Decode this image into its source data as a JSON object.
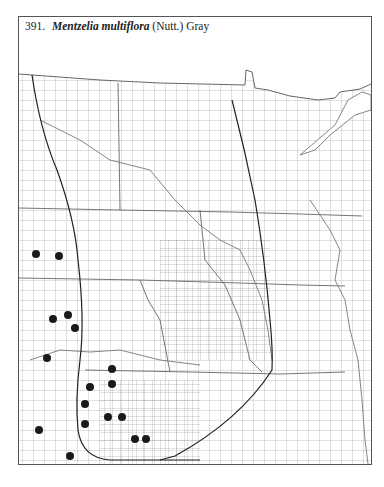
{
  "map": {
    "number": "391.",
    "scientific_name": "Mentzelia multiflora",
    "authority": "(Nutt.) Gray",
    "region": "Great Plains (ND, SD, NE, KS, MN, IA, MO) county outline map",
    "marker_style": "filled black dot",
    "marker_color": "#1a1a1a",
    "occurrence_points": [
      {
        "x": 36,
        "y": 254
      },
      {
        "x": 59,
        "y": 256
      },
      {
        "x": 53,
        "y": 319
      },
      {
        "x": 68,
        "y": 315
      },
      {
        "x": 75,
        "y": 328
      },
      {
        "x": 47,
        "y": 358
      },
      {
        "x": 112,
        "y": 369
      },
      {
        "x": 112,
        "y": 384
      },
      {
        "x": 90,
        "y": 387
      },
      {
        "x": 85,
        "y": 404
      },
      {
        "x": 85,
        "y": 424
      },
      {
        "x": 108,
        "y": 417
      },
      {
        "x": 122,
        "y": 417
      },
      {
        "x": 135,
        "y": 439
      },
      {
        "x": 146,
        "y": 439
      },
      {
        "x": 39,
        "y": 430
      },
      {
        "x": 70,
        "y": 456
      }
    ]
  }
}
